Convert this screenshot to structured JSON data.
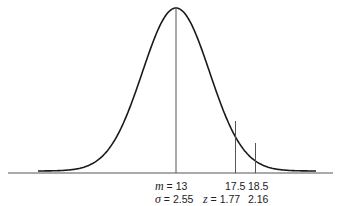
{
  "chart_data": {
    "type": "line",
    "mean": 13,
    "sd": 2.55,
    "markers": [
      {
        "x": 13,
        "label": "m = 13",
        "sublabel": "σ = 2.55"
      },
      {
        "x": 17.5,
        "label": "17.5",
        "z": 1.77,
        "sublabel": "z = 1.77"
      },
      {
        "x": 18.5,
        "label": "18.5",
        "z": 2.16,
        "sublabel": "2.16"
      }
    ],
    "xlabel": "",
    "ylabel": ""
  },
  "labels": {
    "mean_symbol": "m",
    "mean_eq": " = 13",
    "sigma_symbol": "σ",
    "sigma_eq": " = 2.55",
    "x1": "17.5",
    "x2": "18.5",
    "z_symbol": "z",
    "z1_eq": " = 1.77",
    "z2": "2.16"
  },
  "colors": {
    "curve": "#1a1a1a",
    "lines": "#555555",
    "axis": "#444444"
  }
}
